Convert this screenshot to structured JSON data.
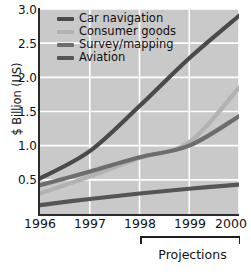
{
  "chart_data": {
    "type": "line",
    "title": "",
    "subtitle": "",
    "xlabel": "",
    "ylabel": "$ Billion (US)",
    "x": [
      1996,
      1997,
      1998,
      1999,
      2000
    ],
    "categories": [
      "1996",
      "1997",
      "1998",
      "1999",
      "2000"
    ],
    "xlim": [
      1996,
      2000
    ],
    "ylim": [
      0,
      3.0
    ],
    "yticks": [
      0.5,
      1.0,
      1.5,
      2.0,
      2.5,
      3.0
    ],
    "ytick_labels": [
      "0.5",
      "1.0",
      "1.5",
      "2.0",
      "2.5",
      "3.0"
    ],
    "xtick_labels": [
      "1996",
      "1997",
      "1998",
      "1999",
      "2000"
    ],
    "grid": true,
    "grid_color": "#ffffff",
    "plot_background": "#c9c9c9",
    "legend_position": "top-left",
    "annotation": "Projections",
    "annotation_span": [
      "1998",
      "2000"
    ],
    "series": [
      {
        "name": "Car navigation",
        "color": "#4a4a4a",
        "values": [
          0.52,
          0.92,
          1.58,
          2.28,
          2.9
        ]
      },
      {
        "name": "Consumer goods",
        "color": "#b2b2b2",
        "values": [
          0.3,
          0.55,
          0.82,
          1.05,
          1.85
        ]
      },
      {
        "name": "Survey/mapping",
        "color": "#6d6d6d",
        "values": [
          0.42,
          0.62,
          0.83,
          1.0,
          1.43
        ]
      },
      {
        "name": "Aviation",
        "color": "#555555",
        "values": [
          0.13,
          0.22,
          0.3,
          0.37,
          0.43
        ]
      }
    ]
  },
  "axis": {
    "y_title": "$ Billion (US)",
    "y_labels": [
      "3.0",
      "2.5",
      "2.0",
      "1.5",
      "1.0",
      "0.5"
    ],
    "x_labels": [
      "1996",
      "1997",
      "1998",
      "1999",
      "2000"
    ]
  },
  "legend": {
    "items": [
      {
        "label": "Car navigation",
        "color": "#4a4a4a"
      },
      {
        "label": "Consumer goods",
        "color": "#b2b2b2"
      },
      {
        "label": "Survey/mapping",
        "color": "#6d6d6d"
      },
      {
        "label": "Aviation",
        "color": "#555555"
      }
    ]
  },
  "annotations": {
    "projections_label": "Projections"
  }
}
